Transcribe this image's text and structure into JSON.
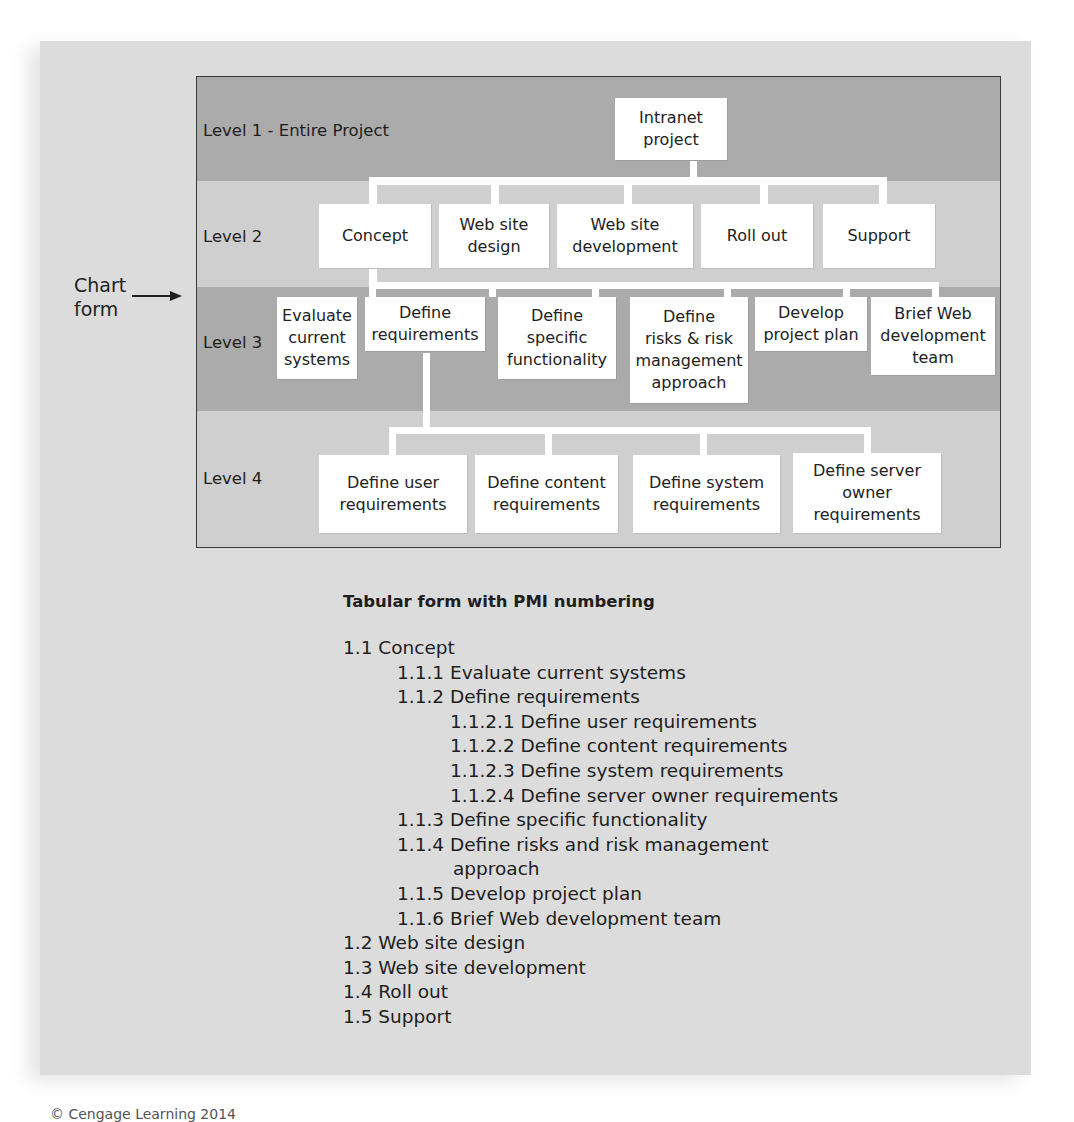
{
  "side_label": {
    "text": "Chart\nform",
    "arrow_icon": "right-arrow-icon"
  },
  "chart": {
    "levels": [
      {
        "label": "Level 1 - Entire Project"
      },
      {
        "label": "Level 2"
      },
      {
        "label": "Level 3"
      },
      {
        "label": "Level 4"
      }
    ],
    "level1": [
      {
        "label": "Intranet\nproject"
      }
    ],
    "level2": [
      {
        "label": "Concept"
      },
      {
        "label": "Web site\ndesign"
      },
      {
        "label": "Web site\ndevelopment"
      },
      {
        "label": "Roll out"
      },
      {
        "label": "Support"
      }
    ],
    "level3": [
      {
        "label": "Evaluate\ncurrent\nsystems"
      },
      {
        "label": "Define\nrequirements"
      },
      {
        "label": "Define\nspecific\nfunctionality"
      },
      {
        "label": "Define\nrisks & risk\nmanagement\napproach"
      },
      {
        "label": "Develop\nproject plan"
      },
      {
        "label": "Brief Web\ndevelopment\nteam"
      }
    ],
    "level4": [
      {
        "label": "Define user\nrequirements"
      },
      {
        "label": "Define content\nrequirements"
      },
      {
        "label": "Define system\nrequirements"
      },
      {
        "label": "Define server\nowner\nrequirements"
      }
    ]
  },
  "tabular": {
    "title": "Tabular form with PMI numbering",
    "items": [
      {
        "text": "1.1 Concept",
        "level": 1
      },
      {
        "text": "1.1.1 Evaluate current systems",
        "level": 2
      },
      {
        "text": "1.1.2 Define requirements",
        "level": 2
      },
      {
        "text": "1.1.2.1 Define user requirements",
        "level": 3
      },
      {
        "text": "1.1.2.2 Define content requirements",
        "level": 3
      },
      {
        "text": "1.1.2.3 Define system requirements",
        "level": 3
      },
      {
        "text": "1.1.2.4 Define server owner requirements",
        "level": 3
      },
      {
        "text": "1.1.3 Define specific functionality",
        "level": 2
      },
      {
        "text": "1.1.4 Define risks and risk management",
        "level": 2
      },
      {
        "text": "approach",
        "level": "2c"
      },
      {
        "text": "1.1.5 Develop project plan",
        "level": 2
      },
      {
        "text": "1.1.6 Brief Web development team",
        "level": 2
      },
      {
        "text": "1.2 Web site design",
        "level": 1
      },
      {
        "text": "1.3 Web site development",
        "level": 1
      },
      {
        "text": "1.4 Roll out",
        "level": 1
      },
      {
        "text": "1.5 Support",
        "level": 1
      }
    ]
  },
  "footer": {
    "copyright": "© Cengage Learning 2014"
  },
  "colors": {
    "panel": "#dcdcdc",
    "band_dark": "#ababab",
    "band_light": "#cfcfcf",
    "node": "#ffffff",
    "border": "#3a3a3a"
  }
}
